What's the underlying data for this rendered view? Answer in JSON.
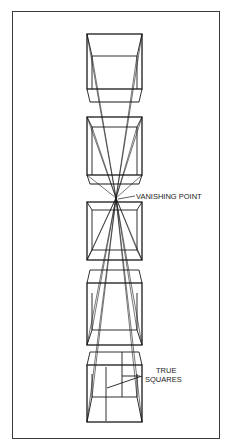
{
  "figure": {
    "labels": {
      "vanishing_point": "VANISHING POINT",
      "true_squares_line1": "TRUE",
      "true_squares_line2": "SQUARES"
    },
    "vanishing_point": {
      "x": 116,
      "y": 198
    },
    "stroke_color": "#1a1a1a",
    "frame_color": "#3a3a3a",
    "cubes": [
      {
        "id": 1,
        "top": 34,
        "bottom": 89,
        "inner": 56,
        "band_bottom": 102
      },
      {
        "id": 2,
        "top": 117,
        "bottom": 175,
        "inner": 127,
        "band_bottom": 184
      },
      {
        "id": 3,
        "top": 202,
        "bottom": 260,
        "inner": 210,
        "band_bottom": 250
      },
      {
        "id": 4,
        "top": 283,
        "bottom": 345,
        "inner": 293,
        "band_bottom": 330
      },
      {
        "id": 5,
        "top": 365,
        "bottom": 422,
        "inner": 374,
        "band_bottom": 397
      }
    ]
  }
}
